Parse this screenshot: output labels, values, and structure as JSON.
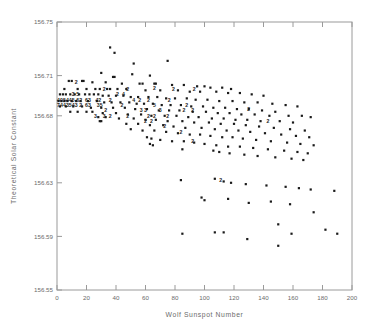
{
  "chart_data": {
    "type": "scatter",
    "title": "",
    "xlabel": "Wolf Sunspot Number",
    "ylabel": "Theoretical Solar Constant",
    "xlim": [
      0,
      200
    ],
    "ylim": [
      156.55,
      156.75
    ],
    "grid": false,
    "legend": null,
    "xticks": [
      0,
      20,
      40,
      60,
      80,
      100,
      120,
      140,
      160,
      180,
      200
    ],
    "xticklabels": [
      "0",
      "20",
      "40",
      "60",
      "80",
      "100",
      "120",
      "140",
      "160",
      "180",
      "200"
    ],
    "yticks": [
      156.55,
      156.59,
      156.63,
      156.68,
      156.71,
      156.75
    ],
    "yticklabels": [
      "156.55",
      "156.59",
      "156.63",
      "156.68",
      "156.71",
      "156.75"
    ],
    "marker": "filled-square-dot",
    "marker_color": "#1a1a1a",
    "note": "Dense overlapping points in the low-sunspot cluster are printed as digit glyphs indicating the count of coincident observations.",
    "points": [
      [
        36,
        156.731
      ],
      [
        39,
        156.727
      ],
      [
        52,
        156.719
      ],
      [
        75,
        156.721
      ],
      [
        30,
        156.712
      ],
      [
        38,
        156.709
      ],
      [
        39,
        156.709
      ],
      [
        51,
        156.711
      ],
      [
        63,
        156.71
      ],
      [
        8,
        156.706
      ],
      [
        10,
        156.706
      ],
      [
        17,
        156.706
      ],
      [
        18,
        156.706
      ],
      [
        24,
        156.705
      ],
      [
        33,
        156.705
      ],
      [
        44,
        156.704
      ],
      [
        56,
        156.704
      ],
      [
        58,
        156.704
      ],
      [
        66,
        156.704
      ],
      [
        67,
        156.704
      ],
      [
        78,
        156.703
      ],
      [
        86,
        156.703
      ],
      [
        95,
        156.702
      ],
      [
        100,
        156.702
      ],
      [
        104,
        156.701
      ],
      [
        112,
        156.701
      ],
      [
        118,
        156.7
      ],
      [
        5,
        156.7
      ],
      [
        14,
        156.7
      ],
      [
        20,
        156.7
      ],
      [
        26,
        156.7
      ],
      [
        29,
        156.7
      ],
      [
        34,
        156.7
      ],
      [
        36,
        156.7
      ],
      [
        41,
        156.7
      ],
      [
        47,
        156.7
      ],
      [
        60,
        156.699
      ],
      [
        70,
        156.699
      ],
      [
        82,
        156.699
      ],
      [
        90,
        156.698
      ],
      [
        97,
        156.698
      ],
      [
        108,
        156.698
      ],
      [
        116,
        156.697
      ],
      [
        124,
        156.697
      ],
      [
        132,
        156.696
      ],
      [
        140,
        156.695
      ],
      [
        2,
        156.696
      ],
      [
        4,
        156.696
      ],
      [
        6,
        156.696
      ],
      [
        9,
        156.696
      ],
      [
        12,
        156.696
      ],
      [
        15,
        156.696
      ],
      [
        19,
        156.696
      ],
      [
        22,
        156.696
      ],
      [
        25,
        156.696
      ],
      [
        28,
        156.696
      ],
      [
        31,
        156.695
      ],
      [
        35,
        156.695
      ],
      [
        40,
        156.695
      ],
      [
        45,
        156.695
      ],
      [
        50,
        156.694
      ],
      [
        55,
        156.694
      ],
      [
        62,
        156.694
      ],
      [
        68,
        156.694
      ],
      [
        74,
        156.693
      ],
      [
        80,
        156.693
      ],
      [
        88,
        156.693
      ],
      [
        94,
        156.692
      ],
      [
        102,
        156.692
      ],
      [
        110,
        156.691
      ],
      [
        119,
        156.691
      ],
      [
        127,
        156.69
      ],
      [
        136,
        156.69
      ],
      [
        146,
        156.689
      ],
      [
        155,
        156.688
      ],
      [
        163,
        156.687
      ],
      [
        1,
        156.691
      ],
      [
        3,
        156.691
      ],
      [
        5,
        156.691
      ],
      [
        7,
        156.691
      ],
      [
        10,
        156.691
      ],
      [
        13,
        156.691
      ],
      [
        16,
        156.691
      ],
      [
        21,
        156.691
      ],
      [
        27,
        156.691
      ],
      [
        32,
        156.69
      ],
      [
        37,
        156.69
      ],
      [
        43,
        156.69
      ],
      [
        49,
        156.69
      ],
      [
        54,
        156.689
      ],
      [
        59,
        156.689
      ],
      [
        65,
        156.689
      ],
      [
        71,
        156.688
      ],
      [
        77,
        156.688
      ],
      [
        84,
        156.688
      ],
      [
        91,
        156.687
      ],
      [
        99,
        156.687
      ],
      [
        106,
        156.686
      ],
      [
        114,
        156.686
      ],
      [
        122,
        156.685
      ],
      [
        130,
        156.685
      ],
      [
        139,
        156.684
      ],
      [
        148,
        156.683
      ],
      [
        2,
        156.687
      ],
      [
        6,
        156.687
      ],
      [
        11,
        156.687
      ],
      [
        17,
        156.687
      ],
      [
        23,
        156.686
      ],
      [
        30,
        156.686
      ],
      [
        38,
        156.686
      ],
      [
        46,
        156.686
      ],
      [
        53,
        156.685
      ],
      [
        61,
        156.685
      ],
      [
        69,
        156.684
      ],
      [
        76,
        156.684
      ],
      [
        83,
        156.684
      ],
      [
        92,
        156.683
      ],
      [
        101,
        156.683
      ],
      [
        109,
        156.682
      ],
      [
        117,
        156.682
      ],
      [
        125,
        156.681
      ],
      [
        134,
        156.681
      ],
      [
        144,
        156.68
      ],
      [
        157,
        156.68
      ],
      [
        166,
        156.68
      ],
      [
        172,
        156.679
      ],
      [
        9,
        156.683
      ],
      [
        14,
        156.683
      ],
      [
        20,
        156.683
      ],
      [
        24,
        156.683
      ],
      [
        31,
        156.682
      ],
      [
        40,
        156.682
      ],
      [
        48,
        156.681
      ],
      [
        57,
        156.681
      ],
      [
        64,
        156.68
      ],
      [
        73,
        156.68
      ],
      [
        81,
        156.68
      ],
      [
        89,
        156.679
      ],
      [
        96,
        156.679
      ],
      [
        105,
        156.678
      ],
      [
        113,
        156.678
      ],
      [
        121,
        156.677
      ],
      [
        129,
        156.677
      ],
      [
        138,
        156.676
      ],
      [
        151,
        156.676
      ],
      [
        160,
        156.675
      ],
      [
        28,
        156.679
      ],
      [
        33,
        156.679
      ],
      [
        42,
        156.678
      ],
      [
        52,
        156.678
      ],
      [
        60,
        156.677
      ],
      [
        67,
        156.677
      ],
      [
        75,
        156.676
      ],
      [
        85,
        156.676
      ],
      [
        93,
        156.675
      ],
      [
        103,
        156.675
      ],
      [
        111,
        156.674
      ],
      [
        120,
        156.674
      ],
      [
        128,
        156.673
      ],
      [
        137,
        156.672
      ],
      [
        147,
        156.671
      ],
      [
        158,
        156.67
      ],
      [
        168,
        156.669
      ],
      [
        29,
        156.676
      ],
      [
        30,
        156.676
      ],
      [
        47,
        156.674
      ],
      [
        55,
        156.674
      ],
      [
        63,
        156.673
      ],
      [
        72,
        156.673
      ],
      [
        79,
        156.672
      ],
      [
        87,
        156.671
      ],
      [
        98,
        156.671
      ],
      [
        107,
        156.67
      ],
      [
        115,
        156.669
      ],
      [
        123,
        156.669
      ],
      [
        131,
        156.668
      ],
      [
        141,
        156.667
      ],
      [
        152,
        156.666
      ],
      [
        162,
        156.665
      ],
      [
        171,
        156.664
      ],
      [
        50,
        156.67
      ],
      [
        58,
        156.669
      ],
      [
        66,
        156.669
      ],
      [
        74,
        156.668
      ],
      [
        82,
        156.667
      ],
      [
        90,
        156.666
      ],
      [
        97,
        156.666
      ],
      [
        104,
        156.665
      ],
      [
        112,
        156.664
      ],
      [
        119,
        156.664
      ],
      [
        126,
        156.663
      ],
      [
        135,
        156.662
      ],
      [
        145,
        156.661
      ],
      [
        156,
        156.66
      ],
      [
        165,
        156.659
      ],
      [
        174,
        156.658
      ],
      [
        61,
        156.664
      ],
      [
        64,
        156.663
      ],
      [
        70,
        156.662
      ],
      [
        78,
        156.661
      ],
      [
        86,
        156.661
      ],
      [
        93,
        156.66
      ],
      [
        100,
        156.659
      ],
      [
        108,
        156.658
      ],
      [
        116,
        156.657
      ],
      [
        124,
        156.657
      ],
      [
        133,
        156.656
      ],
      [
        143,
        156.655
      ],
      [
        154,
        156.654
      ],
      [
        163,
        156.653
      ],
      [
        170,
        156.652
      ],
      [
        63,
        156.659
      ],
      [
        65,
        156.658
      ],
      [
        85,
        156.655
      ],
      [
        106,
        156.654
      ],
      [
        110,
        156.653
      ],
      [
        117,
        156.652
      ],
      [
        127,
        156.651
      ],
      [
        136,
        156.65
      ],
      [
        148,
        156.649
      ],
      [
        159,
        156.648
      ],
      [
        167,
        156.647
      ],
      [
        84,
        156.632
      ],
      [
        107,
        156.633
      ],
      [
        113,
        156.631
      ],
      [
        118,
        156.63
      ],
      [
        128,
        156.629
      ],
      [
        142,
        156.628
      ],
      [
        155,
        156.627
      ],
      [
        164,
        156.626
      ],
      [
        172,
        156.625
      ],
      [
        188,
        156.624
      ],
      [
        98,
        156.619
      ],
      [
        100,
        156.617
      ],
      [
        116,
        156.618
      ],
      [
        130,
        156.615
      ],
      [
        145,
        156.616
      ],
      [
        158,
        156.614
      ],
      [
        150,
        156.599
      ],
      [
        174,
        156.608
      ],
      [
        182,
        156.595
      ],
      [
        190,
        156.592
      ],
      [
        85,
        156.592
      ],
      [
        107,
        156.593
      ],
      [
        113,
        156.593
      ],
      [
        129,
        156.588
      ],
      [
        150,
        156.583
      ],
      [
        159,
        156.592
      ]
    ],
    "overplot_labels": [
      {
        "x": 13,
        "y": 156.705,
        "text": "2"
      },
      {
        "x": 32,
        "y": 156.7,
        "text": "2"
      },
      {
        "x": 48,
        "y": 156.7,
        "text": "2"
      },
      {
        "x": 66,
        "y": 156.701,
        "text": "2"
      },
      {
        "x": 79,
        "y": 156.7,
        "text": "2"
      },
      {
        "x": 93,
        "y": 156.7,
        "text": "2"
      },
      {
        "x": 11,
        "y": 156.696,
        "text": "3"
      },
      {
        "x": 14,
        "y": 156.696,
        "text": "5"
      },
      {
        "x": 41,
        "y": 156.696,
        "text": "2"
      },
      {
        "x": 45,
        "y": 156.696,
        "text": "4"
      },
      {
        "x": 1,
        "y": 156.692,
        "text": "4"
      },
      {
        "x": 3,
        "y": 156.692,
        "text": "0"
      },
      {
        "x": 5,
        "y": 156.692,
        "text": "5"
      },
      {
        "x": 7,
        "y": 156.692,
        "text": "4"
      },
      {
        "x": 9,
        "y": 156.692,
        "text": "4"
      },
      {
        "x": 11,
        "y": 156.692,
        "text": "5"
      },
      {
        "x": 14,
        "y": 156.692,
        "text": "6"
      },
      {
        "x": 16,
        "y": 156.692,
        "text": "2"
      },
      {
        "x": 20,
        "y": 156.692,
        "text": "6"
      },
      {
        "x": 22,
        "y": 156.692,
        "text": "3"
      },
      {
        "x": 27,
        "y": 156.692,
        "text": "4"
      },
      {
        "x": 29,
        "y": 156.692,
        "text": "2"
      },
      {
        "x": 36,
        "y": 156.692,
        "text": "2"
      },
      {
        "x": 52,
        "y": 156.692,
        "text": "4"
      },
      {
        "x": 56,
        "y": 156.692,
        "text": "2"
      },
      {
        "x": 62,
        "y": 156.692,
        "text": "2"
      },
      {
        "x": 76,
        "y": 156.692,
        "text": "2"
      },
      {
        "x": 1,
        "y": 156.688,
        "text": "7"
      },
      {
        "x": 3,
        "y": 156.688,
        "text": "4"
      },
      {
        "x": 5,
        "y": 156.688,
        "text": "4"
      },
      {
        "x": 7,
        "y": 156.688,
        "text": "3"
      },
      {
        "x": 9,
        "y": 156.688,
        "text": "5"
      },
      {
        "x": 11,
        "y": 156.688,
        "text": "4"
      },
      {
        "x": 13,
        "y": 156.688,
        "text": "3"
      },
      {
        "x": 16,
        "y": 156.688,
        "text": "2"
      },
      {
        "x": 20,
        "y": 156.688,
        "text": "6"
      },
      {
        "x": 22,
        "y": 156.688,
        "text": "3"
      },
      {
        "x": 28,
        "y": 156.688,
        "text": "3"
      },
      {
        "x": 30,
        "y": 156.688,
        "text": "5"
      },
      {
        "x": 44,
        "y": 156.688,
        "text": "2"
      },
      {
        "x": 66,
        "y": 156.688,
        "text": "5"
      },
      {
        "x": 88,
        "y": 156.688,
        "text": "2"
      },
      {
        "x": 33,
        "y": 156.684,
        "text": "2"
      },
      {
        "x": 57,
        "y": 156.684,
        "text": "3"
      },
      {
        "x": 60,
        "y": 156.684,
        "text": "3"
      },
      {
        "x": 70,
        "y": 156.684,
        "text": "3"
      },
      {
        "x": 86,
        "y": 156.684,
        "text": "2"
      },
      {
        "x": 92,
        "y": 156.684,
        "text": "2"
      },
      {
        "x": 26,
        "y": 156.68,
        "text": "3"
      },
      {
        "x": 32,
        "y": 156.68,
        "text": "3"
      },
      {
        "x": 36,
        "y": 156.68,
        "text": "2"
      },
      {
        "x": 48,
        "y": 156.68,
        "text": "2"
      },
      {
        "x": 62,
        "y": 156.68,
        "text": "2"
      },
      {
        "x": 66,
        "y": 156.68,
        "text": "2"
      },
      {
        "x": 75,
        "y": 156.68,
        "text": "2"
      },
      {
        "x": 60,
        "y": 156.676,
        "text": "2"
      },
      {
        "x": 64,
        "y": 156.676,
        "text": "2"
      },
      {
        "x": 73,
        "y": 156.672,
        "text": "2"
      },
      {
        "x": 84,
        "y": 156.668,
        "text": "2"
      },
      {
        "x": 92,
        "y": 156.661,
        "text": "2"
      },
      {
        "x": 143,
        "y": 156.676,
        "text": "2"
      },
      {
        "x": 130,
        "y": 156.685,
        "text": "2"
      },
      {
        "x": 111,
        "y": 156.632,
        "text": "2"
      }
    ]
  }
}
